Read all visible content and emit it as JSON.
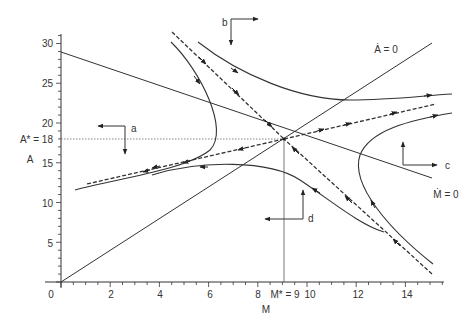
{
  "figure": {
    "type": "phase-diagram",
    "x_axis": {
      "label": "M",
      "ticks": [
        "0",
        "2",
        "4",
        "6",
        "8",
        "M* = 9",
        "10",
        "12",
        "14"
      ],
      "range": [
        0,
        15.5
      ]
    },
    "y_axis": {
      "label": "A",
      "ticks": [
        "5",
        "10",
        "15",
        "A* = 18",
        "20",
        "25",
        "30"
      ],
      "range": [
        0,
        31
      ]
    },
    "equilibrium": {
      "M": 9,
      "A": 18,
      "M_label": "M* = 9",
      "A_label": "A* = 18"
    },
    "isoclines": {
      "a_dot": {
        "label": "Ȧ = 0",
        "from": [
          0,
          0
        ],
        "to": [
          15,
          30
        ]
      },
      "m_dot": {
        "label": "Ṁ = 0",
        "from": [
          0,
          29
        ],
        "to": [
          15,
          13
        ]
      }
    },
    "regions": [
      {
        "label": "a",
        "horizontal": "left",
        "vertical": "down"
      },
      {
        "label": "b",
        "horizontal": "right",
        "vertical": "down"
      },
      {
        "label": "c",
        "horizontal": "right",
        "vertical": "up"
      },
      {
        "label": "d",
        "horizontal": "left",
        "vertical": "up"
      }
    ],
    "saddle_paths": {
      "stable": "dashed line from upper-left and lower-right converging to equilibrium",
      "unstable": "dashed line from equilibrium diverging to lower-left and upper-right"
    }
  }
}
